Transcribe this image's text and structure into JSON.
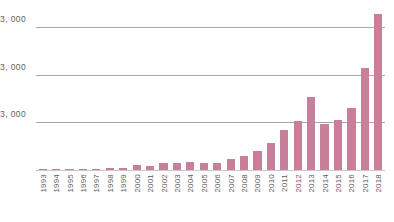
{
  "chart_data": {
    "type": "bar",
    "title": "",
    "subtitle": "",
    "xlabel": "",
    "ylabel": "",
    "grid": true,
    "legend": false,
    "legend_position": "none",
    "bar_color": "#c8809a",
    "gridline_color": "#a8a8a8",
    "axis_color": "#c9c9c9",
    "label_color": "#5e5e5e",
    "ylim": [
      0,
      10560
    ],
    "ytick_values": [
      3000,
      6000,
      9000
    ],
    "ytick_labels": [
      "3, 000",
      "3, 000",
      "3, 000"
    ],
    "categories": [
      "1993",
      "1994",
      "1995",
      "1996",
      "1997",
      "1998",
      "1999",
      "2000",
      "2001",
      "2002",
      "2003",
      "2004",
      "2005",
      "2006",
      "2007",
      "2008",
      "2009",
      "2010",
      "2011",
      "2012",
      "2013",
      "2014",
      "2015",
      "2016",
      "2017",
      "2018"
    ],
    "values": [
      40,
      60,
      70,
      70,
      80,
      110,
      150,
      300,
      250,
      420,
      430,
      500,
      450,
      470,
      700,
      900,
      1200,
      1700,
      2500,
      3100,
      4600,
      2900,
      3150,
      3900,
      6400,
      9800
    ]
  }
}
